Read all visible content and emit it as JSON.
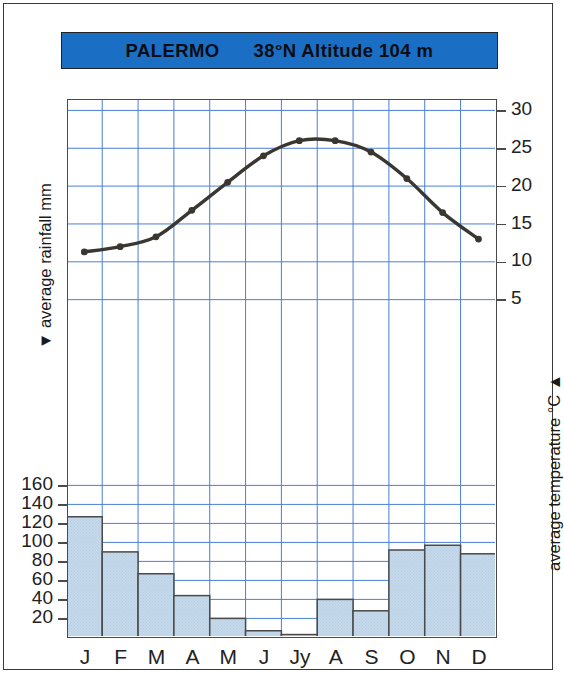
{
  "title": {
    "station": "PALERMO",
    "coords": "38°N Altitude 104 m",
    "bar_color": "#1a6fc4"
  },
  "axes": {
    "left_title": "▼ average rainfall mm",
    "right_title": "average temperature °C ▲",
    "left_ticks": [
      "160",
      "140",
      "120",
      "100",
      "80",
      "60",
      "40",
      "20"
    ],
    "right_ticks": [
      "30",
      "25",
      "20",
      "15",
      "10",
      "5"
    ]
  },
  "chart_data": {
    "type": "bar",
    "title": "PALERMO 38°N Altitude 104 m",
    "xlabel": "",
    "ylabel": "average rainfall mm",
    "y2label": "average temperature °C",
    "grid": true,
    "legend": "none",
    "categories": [
      "J",
      "F",
      "M",
      "A",
      "M",
      "J",
      "Jy",
      "A",
      "S",
      "O",
      "N",
      "D"
    ],
    "series": [
      {
        "name": "average rainfall mm",
        "type": "bar",
        "color": "#c5d9ea",
        "edge_color": "#4a4a4a",
        "ylim": [
          0,
          180
        ],
        "yticks": [
          20,
          40,
          60,
          80,
          100,
          120,
          140,
          160
        ],
        "values": [
          127,
          90,
          67,
          44,
          20,
          7,
          3,
          40,
          28,
          92,
          97,
          88
        ]
      },
      {
        "name": "average temperature °C",
        "type": "line",
        "color": "#3a3630",
        "ylim": [
          0,
          35
        ],
        "yticks": [
          5,
          10,
          15,
          20,
          25,
          30
        ],
        "values": [
          11.3,
          12.0,
          13.3,
          16.8,
          20.5,
          24.0,
          26.0,
          26.0,
          24.5,
          21.0,
          16.5,
          13.0
        ]
      }
    ]
  },
  "colors": {
    "grid": "#4a7fd4",
    "frame": "#4a4a4a",
    "bar_fill": "#c5d9ea",
    "line": "#3a3630"
  }
}
